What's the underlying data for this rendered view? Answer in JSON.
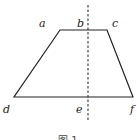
{
  "figure": {
    "caption": "图 1",
    "labels": {
      "a": "a",
      "b": "b",
      "c": "c",
      "d": "d",
      "e": "e",
      "f": "f"
    },
    "shape": "isosceles trapezoid",
    "axis": "dashed vertical line of symmetry through b and e",
    "colors": {
      "stroke": "#222222",
      "background": "#ffffff"
    }
  }
}
